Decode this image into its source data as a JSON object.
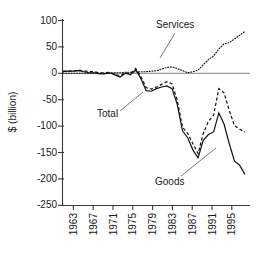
{
  "chart_data": {
    "type": "line",
    "title": "",
    "xlabel": "",
    "ylabel": "$ (billion)",
    "ylim": [
      -250,
      100
    ],
    "xlim": [
      1961,
      1997
    ],
    "grid": false,
    "legend_position": "inline-annotations",
    "yticks": [
      "100",
      "50",
      "0",
      "-50",
      "-100",
      "-150",
      "-200",
      "-250"
    ],
    "ytick_values": [
      100,
      50,
      0,
      -50,
      -100,
      -150,
      -200,
      -250
    ],
    "xticks": [
      "1963",
      "1967",
      "1971",
      "1975",
      "1979",
      "1983",
      "1987",
      "1991",
      "1995"
    ],
    "xtick_values": [
      1963,
      1967,
      1971,
      1975,
      1979,
      1983,
      1987,
      1991,
      1995
    ],
    "annotations": [
      {
        "text": "Services",
        "series": "Services"
      },
      {
        "text": "Total",
        "series": "Total"
      },
      {
        "text": "Goods",
        "series": "Goods"
      }
    ],
    "x": [
      1961,
      1962,
      1963,
      1964,
      1965,
      1966,
      1967,
      1968,
      1969,
      1970,
      1971,
      1972,
      1973,
      1974,
      1975,
      1976,
      1977,
      1978,
      1979,
      1980,
      1981,
      1982,
      1983,
      1984,
      1985,
      1986,
      1987,
      1988,
      1989,
      1990,
      1991,
      1992,
      1993,
      1994,
      1995,
      1996
    ],
    "series": [
      {
        "name": "Total",
        "style": "dashed",
        "values": [
          4,
          4,
          4,
          6,
          5,
          3,
          3,
          1,
          1,
          2,
          -2,
          -5,
          1,
          -1,
          9,
          -6,
          -27,
          -30,
          -26,
          -21,
          -16,
          -20,
          -51,
          -102,
          -114,
          -133,
          -152,
          -114,
          -91,
          -79,
          -29,
          -37,
          -70,
          -99,
          -106,
          -111
        ]
      },
      {
        "name": "Goods",
        "style": "solid",
        "values": [
          3,
          4,
          4,
          5,
          3,
          1,
          1,
          -1,
          -1,
          1,
          -3,
          -7,
          0,
          -3,
          7,
          -10,
          -33,
          -34,
          -29,
          -26,
          -24,
          -29,
          -59,
          -109,
          -122,
          -145,
          -160,
          -127,
          -116,
          -111,
          -75,
          -96,
          -133,
          -166,
          -174,
          -191
        ]
      },
      {
        "name": "Services",
        "style": "dotted",
        "values": [
          0,
          0,
          0,
          0,
          0,
          0,
          0,
          0,
          0,
          0,
          1,
          1,
          2,
          2,
          3,
          3,
          3,
          4,
          5,
          8,
          11,
          12,
          9,
          5,
          1,
          3,
          6,
          16,
          26,
          33,
          46,
          56,
          58,
          65,
          72,
          79
        ]
      }
    ]
  },
  "figure": {
    "background_color": "#ffffff",
    "line_color": "#111111",
    "frame_color": "#3a3a3a",
    "zero_line_color": "#9a9a9a"
  }
}
